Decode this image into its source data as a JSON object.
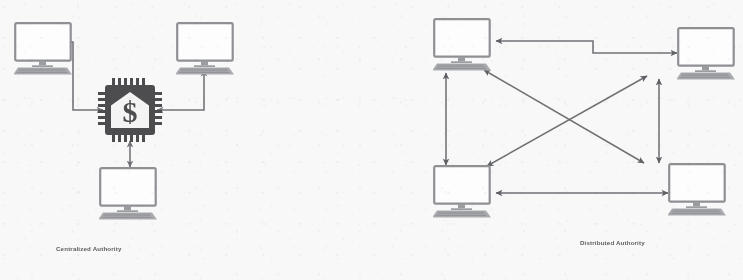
{
  "figure": {
    "type": "diagram",
    "background_color": "#f8f8f8",
    "stroke_color": "#6f7175",
    "icon_fill_color": "#4a4a4d",
    "caption_color": "#5d5d62"
  },
  "panels": [
    {
      "id": "centralized",
      "caption": "Centralized Authority",
      "central_node": {
        "icon": "cpu-chip-bank-dollar-icon",
        "label_symbol": "$",
        "shape": "processor chip with bank building and dollar sign"
      },
      "nodes": [
        {
          "id": "node-top-left",
          "icon": "computer-monitor-icon",
          "position": "top-left"
        },
        {
          "id": "node-top-right",
          "icon": "computer-monitor-icon",
          "position": "top-right"
        },
        {
          "id": "node-bottom",
          "icon": "computer-monitor-icon",
          "position": "bottom-center"
        }
      ],
      "connections": [
        {
          "from": "central-chip",
          "to": "node-top-left",
          "style": "elbow",
          "arrowheads": "both"
        },
        {
          "from": "node-top-right",
          "to": "central-chip",
          "style": "elbow",
          "arrowheads": "both"
        },
        {
          "from": "central-chip",
          "to": "node-bottom",
          "style": "straight",
          "arrowheads": "both"
        }
      ]
    },
    {
      "id": "distributed",
      "caption": "Distributed Authority",
      "central_node": null,
      "nodes": [
        {
          "id": "node-top-left",
          "icon": "computer-monitor-icon",
          "position": "top-left"
        },
        {
          "id": "node-top-right",
          "icon": "computer-monitor-icon",
          "position": "top-right"
        },
        {
          "id": "node-bottom-left",
          "icon": "computer-monitor-icon",
          "position": "bottom-left"
        },
        {
          "id": "node-bottom-right",
          "icon": "computer-monitor-icon",
          "position": "bottom-right"
        }
      ],
      "connections": [
        {
          "from": "node-top-left",
          "to": "node-top-right",
          "style": "elbow",
          "arrowheads": "both"
        },
        {
          "from": "node-top-left",
          "to": "node-bottom-left",
          "style": "straight",
          "arrowheads": "both"
        },
        {
          "from": "node-top-right",
          "to": "node-bottom-right",
          "style": "straight",
          "arrowheads": "both"
        },
        {
          "from": "node-bottom-left",
          "to": "node-bottom-right",
          "style": "straight",
          "arrowheads": "both"
        },
        {
          "from": "node-top-left",
          "to": "node-bottom-right",
          "style": "diagonal",
          "arrowheads": "both"
        },
        {
          "from": "node-top-right",
          "to": "node-bottom-left",
          "style": "diagonal",
          "arrowheads": "both"
        }
      ]
    }
  ]
}
